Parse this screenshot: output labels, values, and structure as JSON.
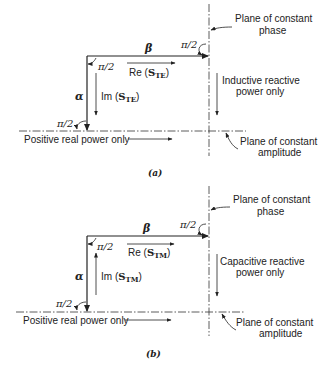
{
  "figures": [
    {
      "id": "a",
      "caption": "(a)",
      "alpha_label": "α",
      "beta_label": "β",
      "angle_label": "π/2",
      "re_label_prefix": "Re (",
      "re_label_sym": "S",
      "re_label_sub": "TE",
      "re_label_suffix": ")",
      "im_label_prefix": "Im (",
      "im_label_sym": "S",
      "im_label_sub": "TE",
      "im_label_suffix": ")",
      "phase_plane_line1": "Plane of constant",
      "phase_plane_line2": "phase",
      "amplitude_plane_line1": "Plane of constant",
      "amplitude_plane_line2": "amplitude",
      "reactive_line1": "Inductive reactive",
      "reactive_line2": "power only",
      "real_power": "Positive real power only",
      "im_arrow_direction": "down"
    },
    {
      "id": "b",
      "caption": "(b)",
      "alpha_label": "α",
      "beta_label": "β",
      "angle_label": "π/2",
      "re_label_prefix": "Re (",
      "re_label_sym": "S",
      "re_label_sub": "TM",
      "re_label_suffix": ")",
      "im_label_prefix": "Im (",
      "im_label_sym": "S",
      "im_label_sub": "TM",
      "im_label_suffix": ")",
      "phase_plane_line1": "Plane of constant",
      "phase_plane_line2": "phase",
      "amplitude_plane_line1": "Plane of constant",
      "amplitude_plane_line2": "amplitude",
      "reactive_line1": "Capacitive reactive",
      "reactive_line2": "power only",
      "real_power": "Positive real power only",
      "im_arrow_direction": "up"
    }
  ]
}
